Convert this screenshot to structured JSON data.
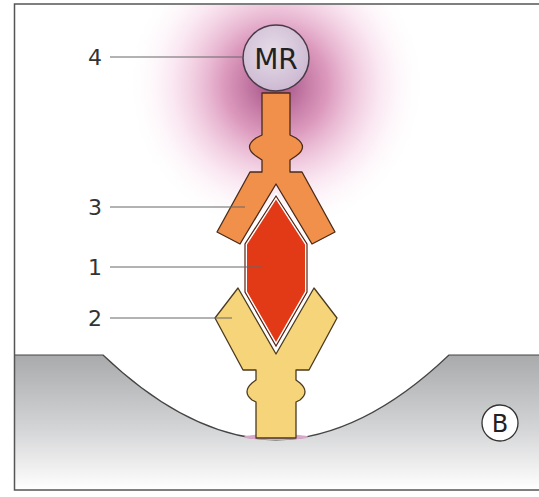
{
  "diagram": {
    "panel_label": "B",
    "center_label": "MR",
    "callouts": [
      {
        "number": "4",
        "y": 57,
        "target": "MR"
      },
      {
        "number": "3",
        "y": 207,
        "target": "orange antibody"
      },
      {
        "number": "1",
        "y": 267,
        "target": "red antigen"
      },
      {
        "number": "2",
        "y": 318,
        "target": "yellow antibody"
      }
    ],
    "colors": {
      "mr_circle": "#d8c8dc",
      "glow": "#b0306e",
      "orange_antibody": "#f0904a",
      "antigen": "#e23a17",
      "yellow_antibody": "#f6d47a",
      "surface": "#b8b9bb",
      "outline": "#3a2a20"
    }
  }
}
